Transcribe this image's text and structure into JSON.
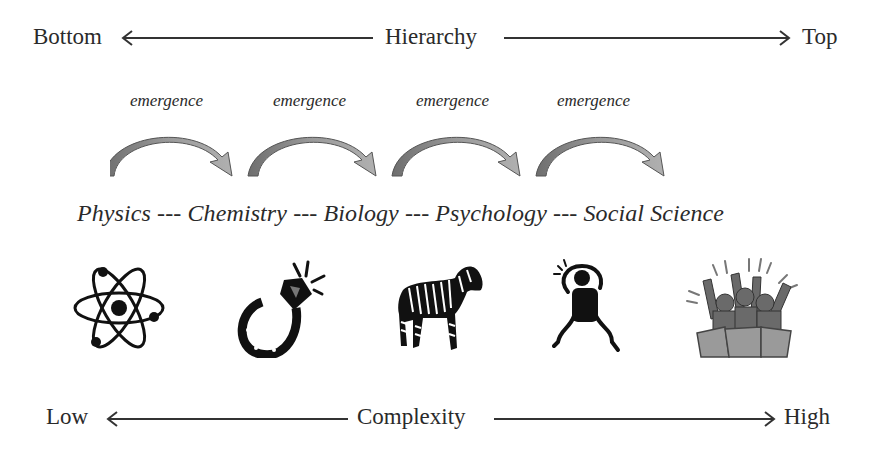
{
  "hierarchy_axis": {
    "left_label": "Bottom",
    "center_label": "Hierarchy",
    "right_label": "Top"
  },
  "emergence_labels": [
    "emergence",
    "emergence",
    "emergence",
    "emergence"
  ],
  "sciences_line": "Physics --- Chemistry --- Biology --- Psychology --- Social Science",
  "sciences": [
    "Physics",
    "Chemistry",
    "Biology",
    "Psychology",
    "Social Science"
  ],
  "icons": [
    {
      "science": "Physics",
      "icon": "atom-icon"
    },
    {
      "science": "Chemistry",
      "icon": "diamond-ring-icon"
    },
    {
      "science": "Biology",
      "icon": "zebra-icon"
    },
    {
      "science": "Psychology",
      "icon": "distressed-person-icon"
    },
    {
      "science": "Social Science",
      "icon": "cheering-crowd-icon"
    }
  ],
  "complexity_axis": {
    "left_label": "Low",
    "center_label": "Complexity",
    "right_label": "High"
  },
  "colors": {
    "text": "#2a2a2a",
    "arrow_fill": "#8a8a8a",
    "arrow_dark": "#555555",
    "icon_black": "#111111"
  }
}
